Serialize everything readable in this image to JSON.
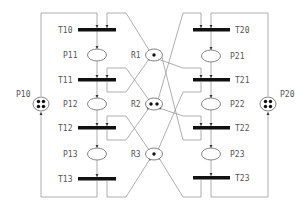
{
  "colors": {
    "transition": "#111111",
    "arc": "#9a9a9a",
    "place_stroke": "#777777",
    "label": "#555555",
    "token": "#111111"
  },
  "idle_places": [
    {
      "id": "P10",
      "label": "P10",
      "x": 41,
      "y": 104,
      "tokens": 4
    },
    {
      "id": "P20",
      "label": "P20",
      "x": 268,
      "y": 104,
      "tokens": 4
    }
  ],
  "resources": [
    {
      "id": "R1",
      "label": "R1",
      "x": 154,
      "y": 55,
      "tokens": 1
    },
    {
      "id": "R2",
      "label": "R2",
      "x": 154,
      "y": 104,
      "tokens": 2
    },
    {
      "id": "R3",
      "label": "R3",
      "x": 154,
      "y": 154,
      "tokens": 1
    }
  ],
  "left_process": {
    "transitions": [
      {
        "id": "T10",
        "label": "T10",
        "y": 30
      },
      {
        "id": "T11",
        "label": "T11",
        "y": 80
      },
      {
        "id": "T12",
        "label": "T12",
        "y": 128
      },
      {
        "id": "T13",
        "label": "T13",
        "y": 179
      }
    ],
    "places": [
      {
        "id": "P11",
        "label": "P11",
        "y": 55
      },
      {
        "id": "P12",
        "label": "P12",
        "y": 104
      },
      {
        "id": "P13",
        "label": "P13",
        "y": 154
      }
    ]
  },
  "right_process": {
    "transitions": [
      {
        "id": "T20",
        "label": "T20",
        "y": 30
      },
      {
        "id": "T21",
        "label": "T21",
        "y": 80
      },
      {
        "id": "T22",
        "label": "T22",
        "y": 128
      },
      {
        "id": "T23",
        "label": "T23",
        "y": 178
      }
    ],
    "places": [
      {
        "id": "P21",
        "label": "P21",
        "y": 56
      },
      {
        "id": "P22",
        "label": "P22",
        "y": 104
      },
      {
        "id": "P23",
        "label": "P23",
        "y": 154
      }
    ]
  }
}
